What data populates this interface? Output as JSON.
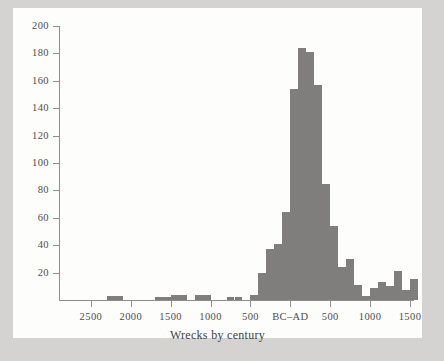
{
  "figure": {
    "background_color": "#fdfdfc",
    "page_background_color": "#d4d3d1",
    "bar_color": "#7f7e7c",
    "axis_color": "#8e8d8b",
    "text_color": "#4d4c4a"
  },
  "chart_data": {
    "type": "bar",
    "title": "",
    "subtitle": "",
    "xlabel": "Wrecks by century",
    "ylabel": "",
    "grid": false,
    "legend": null,
    "ylim": [
      0,
      200
    ],
    "ytick_labels": [
      "20",
      "40",
      "60",
      "80",
      "100",
      "120",
      "140",
      "160",
      "180",
      "200"
    ],
    "ytick_values": [
      20,
      40,
      60,
      80,
      100,
      120,
      140,
      160,
      180,
      200
    ],
    "xtick_labels": [
      "2500",
      "2000",
      "1500",
      "1000",
      "500",
      "BC–AD",
      "500",
      "1000",
      "1500"
    ],
    "xtick_values": [
      -2500,
      -2000,
      -1500,
      -1000,
      -500,
      0,
      500,
      1000,
      1500
    ],
    "xlim": [
      -2900,
      1550
    ],
    "bin_width_years": 100,
    "categories": [
      "-2900",
      "-2800",
      "-2700",
      "-2600",
      "-2500",
      "-2400",
      "-2300",
      "-2200",
      "-2100",
      "-2000",
      "-1900",
      "-1800",
      "-1700",
      "-1600",
      "-1500",
      "-1400",
      "-1300",
      "-1200",
      "-1100",
      "-1000",
      "-900",
      "-800",
      "-700",
      "-600",
      "-500",
      "-400",
      "-300",
      "-200",
      "-100",
      "0",
      "100",
      "200",
      "300",
      "400",
      "500",
      "600",
      "700",
      "800",
      "900",
      "1000",
      "1100",
      "1200",
      "1300",
      "1400",
      "1500"
    ],
    "values": [
      0,
      0,
      0,
      0,
      0,
      0,
      3,
      3,
      0,
      0,
      0,
      0,
      2,
      2,
      4,
      4,
      0,
      4,
      4,
      0,
      0,
      2,
      2,
      0,
      4,
      20,
      37,
      41,
      64,
      154,
      184,
      181,
      157,
      85,
      54,
      24,
      30,
      11,
      3,
      9,
      13,
      10,
      21,
      7,
      15
    ]
  },
  "axis_title": {
    "text": "Wrecks by century"
  }
}
